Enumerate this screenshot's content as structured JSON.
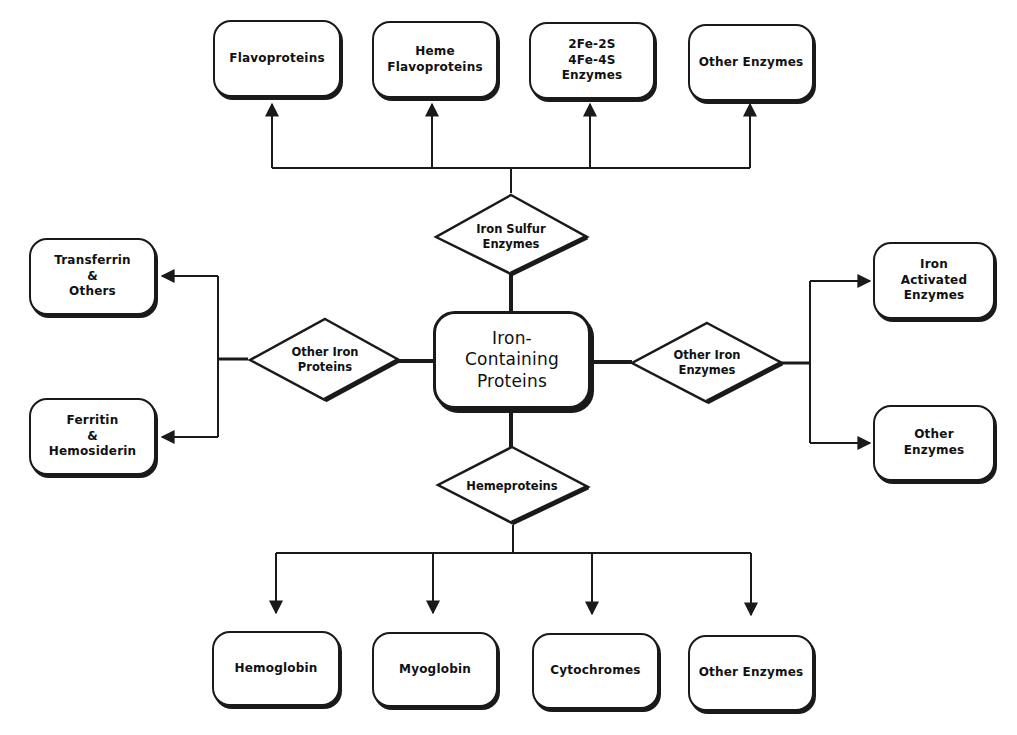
{
  "diagram": {
    "center": {
      "label": "Iron-\nContaining\nProteins"
    },
    "decisions": {
      "top": {
        "label": "Iron  Sulfur\nEnzymes"
      },
      "left": {
        "label": "Other Iron\nProteins"
      },
      "right": {
        "label": "Other Iron\nEnzymes"
      },
      "bottom": {
        "label": "Hemeproteins"
      }
    },
    "top_boxes": [
      {
        "label": "Flavoproteins"
      },
      {
        "label": "Heme\nFlavoproteins"
      },
      {
        "label": "2Fe-2S\n4Fe-4S\nEnzymes"
      },
      {
        "label": "Other Enzymes"
      }
    ],
    "left_boxes": [
      {
        "label": "Transferrin\n&\nOthers"
      },
      {
        "label": "Ferritin\n&\nHemosiderin"
      }
    ],
    "right_boxes": [
      {
        "label": "Iron\nActivated\nEnzymes"
      },
      {
        "label": "Other\nEnzymes"
      }
    ],
    "bottom_boxes": [
      {
        "label": "Hemoglobin"
      },
      {
        "label": "Myoglobin"
      },
      {
        "label": "Cytochromes"
      },
      {
        "label": "Other Enzymes"
      }
    ],
    "colors": {
      "line": "#1a1a1a",
      "fill": "#ffffff"
    }
  }
}
